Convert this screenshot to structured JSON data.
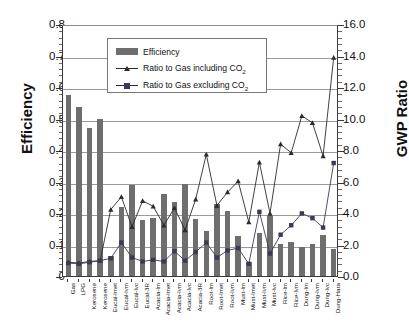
{
  "chart_data": {
    "type": "bar",
    "title": "",
    "xlabel": "",
    "ylabel": "Efficiency",
    "y2label": "GWP Ratio",
    "ylim": [
      0,
      0.8
    ],
    "y2lim": [
      0,
      16.0
    ],
    "grid": true,
    "legend_position": "top-center-inside",
    "yticks": [
      "0",
      "0.1",
      "0.2",
      "0.3",
      "0.4",
      "0.5",
      "0.6",
      "0.7",
      "0.8"
    ],
    "y2ticks": [
      "0.0",
      "2.0",
      "4.0",
      "6.0",
      "8.0",
      "10.0",
      "12.0",
      "14.0",
      "16.0"
    ],
    "categories": [
      "Gas",
      "LPG",
      "Kerosene",
      "Kerosene",
      "Eucal-lmet",
      "Eucal-lvm",
      "Eucal-lvc",
      "Eucal-3R",
      "Acacia-lm",
      "Acacia-lmet",
      "Acacia-lvm",
      "Acacia-lvc",
      "Acacia-3R",
      "Root-lm",
      "Root-lmet",
      "Root-lvm",
      "Must-lm",
      "Must-lmet",
      "Must-lvm",
      "Must-lvc",
      "Rice-lm",
      "Rice-lvm",
      "Dung-lm",
      "Dung-lvm",
      "Dung-lvc",
      "Dung-Hara"
    ],
    "series": [
      {
        "name": "Efficiency",
        "axis": "left",
        "type": "bar",
        "color": "#6e6e6e",
        "values": [
          0.575,
          0.535,
          0.47,
          0.5,
          0.063,
          0.22,
          0.288,
          0.178,
          0.183,
          0.26,
          0.236,
          0.292,
          0.182,
          0.143,
          0.23,
          0.205,
          0.126,
          0.045,
          0.138,
          0.189,
          0.103,
          0.108,
          0.092,
          0.102,
          0.13,
          0.085
        ]
      },
      {
        "name": "Ratio to Gas including CO2",
        "axis": "right",
        "type": "line",
        "marker": "triangle",
        "color": "#2b2b2b",
        "values": [
          1.0,
          0.95,
          1.05,
          1.1,
          4.35,
          5.15,
          3.25,
          4.9,
          4.55,
          3.35,
          4.45,
          3.05,
          5.0,
          7.85,
          4.6,
          5.45,
          6.15,
          3.55,
          7.35,
          4.1,
          8.5,
          7.95,
          10.3,
          9.85,
          7.75,
          14.0
        ]
      },
      {
        "name": "Ratio to Gas excluding CO2",
        "axis": "right",
        "type": "line",
        "marker": "square",
        "color": "#3a3a52",
        "values": [
          0.95,
          0.9,
          1.0,
          1.1,
          1.25,
          2.25,
          1.3,
          1.05,
          1.15,
          1.05,
          1.7,
          1.1,
          1.65,
          2.25,
          1.3,
          1.75,
          1.9,
          0.9,
          4.2,
          1.55,
          2.75,
          3.35,
          4.1,
          3.8,
          3.2,
          7.3
        ]
      }
    ]
  },
  "axes": {
    "left_title": "Efficiency",
    "right_title": "GWP Ratio"
  },
  "legend": {
    "items": [
      {
        "label": "Efficiency",
        "marker": "bar-swatch"
      },
      {
        "label_pre": "Ratio to Gas including CO",
        "label_sub": "2",
        "marker": "triangle-line"
      },
      {
        "label_pre": "Ratio to Gas excluding CO",
        "label_sub": "2",
        "marker": "square-line"
      }
    ]
  }
}
